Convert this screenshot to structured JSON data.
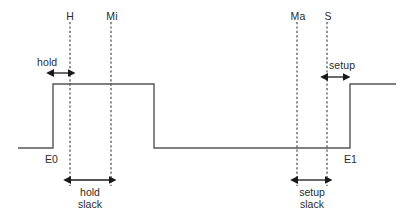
{
  "diagram": {
    "type": "digital-timing-waveform",
    "colors": {
      "waveform": "#555555",
      "dashed_marker": "#4a4a4a",
      "arrow": "#1a1a1a",
      "text": "#2b2b2b",
      "background": "#ffffff"
    },
    "event_labels": {
      "e0": "E0",
      "e1": "E1"
    },
    "marker_labels": {
      "hold_marker": "H",
      "min_marker": "Mi",
      "max_marker": "Ma",
      "setup_marker": "S"
    },
    "interval_labels": {
      "hold": "hold",
      "setup": "setup",
      "hold_slack_line1": "hold",
      "hold_slack_line2": "slack",
      "setup_slack_line1": "setup",
      "setup_slack_line2": "slack"
    },
    "markers": [
      {
        "name": "H",
        "x": 70,
        "y_top": 22,
        "y_bottom": 186
      },
      {
        "name": "Mi",
        "x": 111,
        "y_top": 22,
        "y_bottom": 186
      },
      {
        "name": "Ma",
        "x": 297,
        "y_top": 22,
        "y_bottom": 186
      },
      {
        "name": "S",
        "x": 327,
        "y_top": 22,
        "y_bottom": 186
      }
    ],
    "waveform": {
      "level_high_y": 84,
      "level_low_y": 148,
      "x_start": 18,
      "x_end": 396,
      "edges": [
        {
          "name": "E0",
          "x": 53,
          "direction": "rise"
        },
        {
          "name": "fall",
          "x": 154,
          "direction": "fall"
        },
        {
          "name": "E1",
          "x": 350,
          "direction": "rise"
        }
      ]
    },
    "intervals": [
      {
        "name": "hold",
        "x1": 53,
        "x2": 70,
        "y": 73,
        "label_x": 49,
        "label_y": 57
      },
      {
        "name": "setup",
        "x1": 327,
        "x2": 344,
        "y": 77,
        "label_x": 337,
        "label_y": 61
      },
      {
        "name": "hold-slack",
        "x1": 70,
        "x2": 111,
        "y": 180,
        "label_x": 90,
        "label_y": 186
      },
      {
        "name": "setup-slack",
        "x1": 297,
        "x2": 327,
        "y": 180,
        "label_x": 312,
        "label_y": 186
      }
    ]
  }
}
